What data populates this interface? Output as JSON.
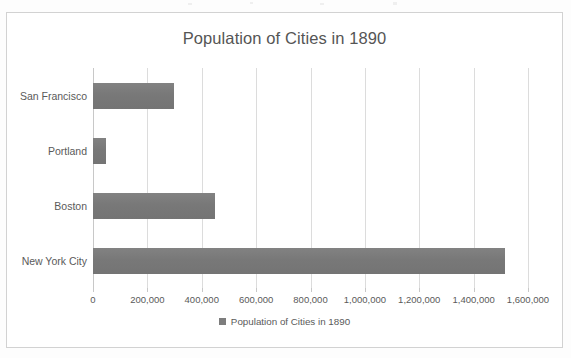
{
  "chart": {
    "title": "Population of Cities in 1890",
    "legend_label": "Population of Cities in 1890",
    "bar_color": "#7d7d7d",
    "frame_color": "#d2d2d2",
    "gridline_color": "#dcdcdc",
    "text_color": "#5a5a5a"
  },
  "chart_data": {
    "type": "bar",
    "orientation": "horizontal",
    "title": "Population of Cities in 1890",
    "xlabel": "",
    "ylabel": "",
    "categories": [
      "New York City",
      "Boston",
      "Portland",
      "San Francisco"
    ],
    "values": [
      1515301,
      448477,
      46385,
      298997
    ],
    "series": [
      {
        "name": "Population of Cities in 1890",
        "values": [
          1515301,
          448477,
          46385,
          298997
        ]
      }
    ],
    "xlim": [
      0,
      1600000
    ],
    "xticks": [
      0,
      200000,
      400000,
      600000,
      800000,
      1000000,
      1200000,
      1400000,
      1600000
    ],
    "xtick_labels": [
      "0",
      "200,000",
      "400,000",
      "600,000",
      "800,000",
      "1,000,000",
      "1,200,000",
      "1,400,000",
      "1,600,000"
    ],
    "grid": "vertical",
    "legend_position": "bottom",
    "legend_entries": [
      "Population of Cities in 1890"
    ]
  }
}
